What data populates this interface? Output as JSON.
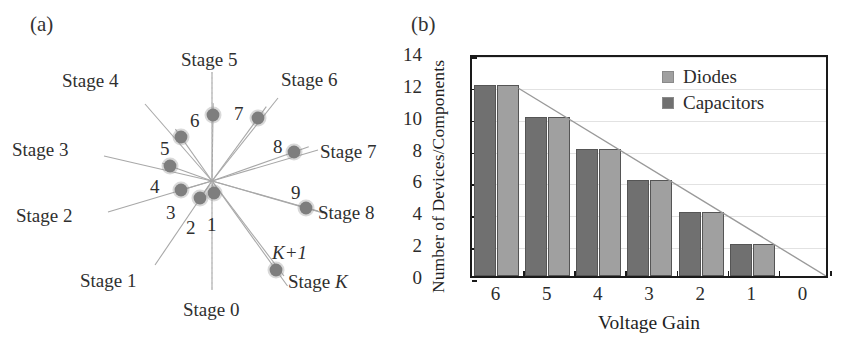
{
  "figure": {
    "panel_a": {
      "tag": "(a)",
      "center": {
        "x": 212,
        "y": 181
      },
      "nodes": [
        {
          "label": "1",
          "x": 214,
          "y": 193,
          "label_x": 207,
          "label_y": 215
        },
        {
          "label": "2",
          "x": 200,
          "y": 198,
          "label_x": 186,
          "label_y": 218
        },
        {
          "label": "3",
          "x": 181,
          "y": 190,
          "label_x": 166,
          "label_y": 203
        },
        {
          "label": "4",
          "x": 170,
          "y": 166,
          "label_x": 150,
          "label_y": 177
        },
        {
          "label": "5",
          "x": 181,
          "y": 137,
          "label_x": 160,
          "label_y": 139
        },
        {
          "label": "6",
          "x": 213,
          "y": 115,
          "label_x": 190,
          "label_y": 111
        },
        {
          "label": "7",
          "x": 258,
          "y": 118,
          "label_x": 234,
          "label_y": 104
        },
        {
          "label": "8",
          "x": 294,
          "y": 152,
          "label_x": 273,
          "label_y": 137
        },
        {
          "label": "9",
          "x": 306,
          "y": 208,
          "label_x": 291,
          "label_y": 183
        },
        {
          "label": "K+1",
          "x": 276,
          "y": 270,
          "label_x": 272,
          "label_y": 243,
          "italic": true
        }
      ],
      "spokes": [
        {
          "label": "Stage 0",
          "label_x": 183,
          "label_y": 300,
          "end_x": 212,
          "end_y": 290
        },
        {
          "label": "Stage 1",
          "label_x": 80,
          "label_y": 271,
          "end_x": 155,
          "end_y": 265
        },
        {
          "label": "Stage 2",
          "label_x": 16,
          "label_y": 206,
          "end_x": 108,
          "end_y": 212
        },
        {
          "label": "Stage 3",
          "label_x": 12,
          "label_y": 140,
          "end_x": 104,
          "end_y": 156
        },
        {
          "label": "Stage 4",
          "label_x": 62,
          "label_y": 71,
          "end_x": 145,
          "end_y": 104
        },
        {
          "label": "Stage 5",
          "label_x": 181,
          "label_y": 50,
          "end_x": 212,
          "end_y": 72
        },
        {
          "label": "Stage 6",
          "label_x": 281,
          "label_y": 70,
          "end_x": 278,
          "end_y": 98
        },
        {
          "label": "Stage 7",
          "label_x": 320,
          "label_y": 142,
          "end_x": 318,
          "end_y": 150
        },
        {
          "label": "Stage 8",
          "label_x": 318,
          "label_y": 203,
          "end_x": 318,
          "end_y": 211
        },
        {
          "label": "Stage K",
          "label_x": 288,
          "label_y": 272,
          "end_x": 284,
          "end_y": 276,
          "italic_tail": "K"
        }
      ],
      "dot_color": "#8c8c8c",
      "spoke_color": "#a8a8a8"
    },
    "panel_b": {
      "tag": "(b)"
    }
  },
  "chart_data": {
    "type": "bar",
    "title": "",
    "xlabel": "Voltage Gain",
    "ylabel": "Number of Devices/Components",
    "categories": [
      "6",
      "5",
      "4",
      "3",
      "2",
      "1",
      "0"
    ],
    "series": [
      {
        "name": "Capacitors",
        "color": "#707070",
        "values": [
          12,
          10,
          8,
          6,
          4,
          2,
          0
        ]
      },
      {
        "name": "Diodes",
        "color": "#a0a0a0",
        "values": [
          12,
          10,
          8,
          6,
          4,
          2,
          0
        ]
      }
    ],
    "legend": [
      {
        "name": "Diodes",
        "color": "#a0a0a0"
      },
      {
        "name": "Capacitors",
        "color": "#707070"
      }
    ],
    "legend_position": "top-right inside",
    "ylim": [
      0,
      14
    ],
    "yticks": [
      "0",
      "2",
      "4",
      "6",
      "8",
      "10",
      "12",
      "14"
    ],
    "xlim_note": "categorical, descending 6 to 0",
    "grid": "horizontal faint gridlines",
    "trendline": {
      "from": {
        "x": "6",
        "y": 12
      },
      "to": {
        "x": "0",
        "y": 0
      },
      "color": "#9a9a9a"
    }
  }
}
